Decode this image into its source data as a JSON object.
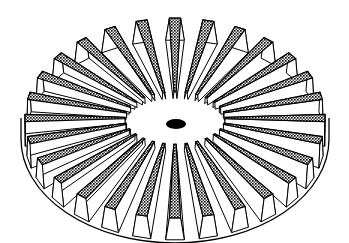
{
  "figure": {
    "style": "black line art with cross-hatched tooth tops",
    "colors": {
      "background": "#ffffff",
      "stroke": "#000000",
      "hatch": "#000000",
      "face": "#ffffff"
    }
  },
  "gear": {
    "teeth": 28,
    "center": [
      175,
      118
    ],
    "outer_radius": [
      150,
      100
    ],
    "inner_radius": [
      50,
      26
    ],
    "tooth_height": 22,
    "skirt_depth": 20,
    "hub_hole": [
      176,
      124,
      10,
      5
    ]
  }
}
